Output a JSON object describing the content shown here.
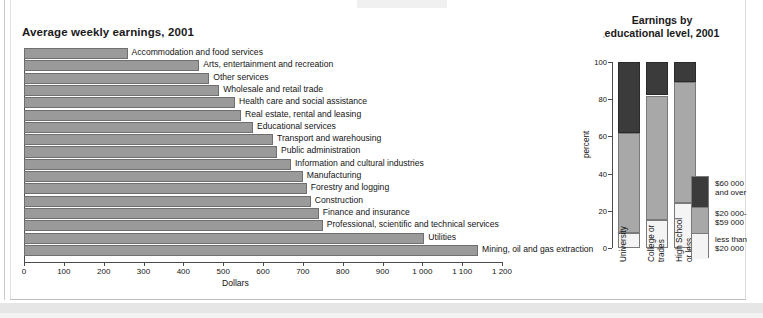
{
  "chart_data": [
    {
      "type": "bar",
      "orientation": "horizontal",
      "title": "Average weekly earnings, 2001",
      "xlabel": "Dollars",
      "ylabel": "",
      "xlim": [
        0,
        1200
      ],
      "xticks": [
        0,
        100,
        200,
        300,
        400,
        500,
        600,
        700,
        800,
        900,
        1000,
        1100,
        1200
      ],
      "xtick_labels": [
        "0",
        "100",
        "200",
        "300",
        "400",
        "500",
        "600",
        "700",
        "800",
        "900",
        "1 000",
        "1 100",
        "1 200"
      ],
      "grid": false,
      "legend": "none",
      "bar_color": "#9a9a9a",
      "categories": [
        "Accommodation and food services",
        "Arts, entertainment and recreation",
        "Other services",
        "Wholesale and retail trade",
        "Health care and social assistance",
        "Real estate, rental and leasing",
        "Educational services",
        "Transport and warehousing",
        "Public administration",
        "Information and cultural industries",
        "Manufacturing",
        "Forestry and logging",
        "Construction",
        "Finance and insurance",
        "Professional, scientific and technical services",
        "Utilities",
        "Mining, oil and gas extraction"
      ],
      "values": [
        260,
        440,
        465,
        490,
        530,
        545,
        575,
        625,
        635,
        670,
        700,
        710,
        720,
        740,
        750,
        1005,
        1140
      ]
    },
    {
      "type": "bar",
      "subtype": "stacked-percent",
      "title": "Earnings by educational level, 2001",
      "xlabel": "",
      "ylabel": "percent",
      "ylim": [
        0,
        100
      ],
      "yticks": [
        0,
        20,
        40,
        60,
        80,
        100
      ],
      "ytick_labels": [
        "0",
        "20",
        "40",
        "60",
        "80",
        "100"
      ],
      "grid": false,
      "legend_position": "right",
      "categories": [
        "University",
        "College or trades",
        "High School or less"
      ],
      "series": [
        {
          "name": "less than $20 000",
          "color": "#f4f4f4",
          "values": [
            8,
            15,
            24
          ]
        },
        {
          "name": "$20 000-$59 000",
          "color": "#a8a8a8",
          "values": [
            54,
            67,
            65
          ]
        },
        {
          "name": "$60 000 and over",
          "color": "#3b3b3b",
          "values": [
            38,
            18,
            11
          ]
        }
      ]
    }
  ],
  "left": {
    "title": "Average weekly earnings, 2001",
    "xlabel": "Dollars",
    "ticks": [
      "0",
      "100",
      "200",
      "300",
      "400",
      "500",
      "600",
      "700",
      "800",
      "900",
      "1 000",
      "1 100",
      "1 200"
    ],
    "bars": [
      {
        "label": "Accommodation and food services",
        "value": 260
      },
      {
        "label": "Arts, entertainment and recreation",
        "value": 440
      },
      {
        "label": "Other services",
        "value": 465
      },
      {
        "label": "Wholesale and retail trade",
        "value": 490
      },
      {
        "label": "Health care and social assistance",
        "value": 530
      },
      {
        "label": "Real estate, rental and leasing",
        "value": 545
      },
      {
        "label": "Educational services",
        "value": 575
      },
      {
        "label": "Transport and warehousing",
        "value": 625
      },
      {
        "label": "Public administration",
        "value": 635
      },
      {
        "label": "Information and cultural industries",
        "value": 670
      },
      {
        "label": "Manufacturing",
        "value": 700
      },
      {
        "label": "Forestry and logging",
        "value": 710
      },
      {
        "label": "Construction",
        "value": 720
      },
      {
        "label": "Finance and insurance",
        "value": 740
      },
      {
        "label": "Professional, scientific and technical services",
        "value": 750
      },
      {
        "label": "Utilities",
        "value": 1005
      },
      {
        "label": "Mining, oil and gas extraction",
        "value": 1140
      }
    ]
  },
  "right": {
    "title_line1": "Earnings by",
    "title_line2": "educational level, 2001",
    "ylabel": "percent",
    "yticks": [
      "0",
      "20",
      "40",
      "60",
      "80",
      "100"
    ],
    "categories": [
      {
        "line1": "University",
        "line2": ""
      },
      {
        "line1": "College or",
        "line2": "trades"
      },
      {
        "line1": "High School",
        "line2": "or less"
      }
    ],
    "legend": [
      {
        "line1": "$60 000",
        "line2": "and over",
        "color": "#3b3b3b"
      },
      {
        "line1": "$20 000-",
        "line2": "$59 000",
        "color": "#a8a8a8"
      },
      {
        "line1": "less than",
        "line2": "$20 000",
        "color": "#f4f4f4"
      }
    ]
  }
}
